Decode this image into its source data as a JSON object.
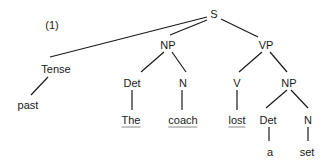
{
  "example_number": "(1)",
  "nodes": {
    "s": "S",
    "tense": "Tense",
    "past": "past",
    "np_subject": "NP",
    "det_subject": "Det",
    "n_subject": "N",
    "the": "The",
    "coach": "coach",
    "vp": "VP",
    "v": "V",
    "lost": "lost",
    "np_object": "NP",
    "det_object": "Det",
    "n_object": "N",
    "a": "a",
    "set": "set"
  },
  "colors": {
    "text": "#1a1a1a",
    "lines": "#1a1a1a",
    "underline": "#8a8a8a",
    "background": "#ffffff"
  }
}
